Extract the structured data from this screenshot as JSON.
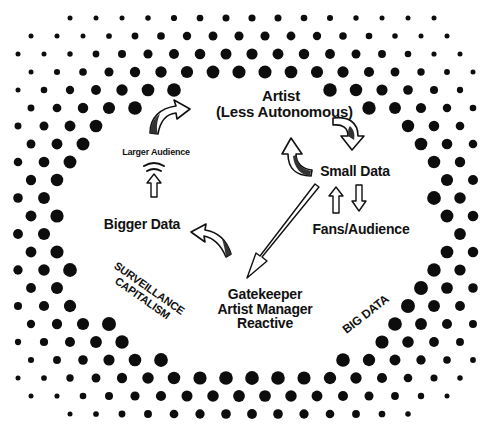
{
  "diagram": {
    "nodes": {
      "artist": {
        "line1": "Artist",
        "line2": "(Less Autonomous)"
      },
      "small_data": {
        "label": "Small Data"
      },
      "fans_audience": {
        "label": "Fans/Audience"
      },
      "gatekeeper": {
        "line1": "Gatekeeper",
        "line2": "Artist Manager",
        "line3": "Reactive"
      },
      "bigger_data": {
        "label": "Bigger Data"
      },
      "larger_audience": {
        "label": "Larger Audience"
      }
    },
    "annotations": {
      "surveillance": {
        "line1": "SURVEILLANCE",
        "line2": "CAPITALISM"
      },
      "big_data": {
        "label": "BIG DATA"
      }
    },
    "arrows": [
      {
        "name": "artist-to-small-data",
        "from": "Artist",
        "to": "Small Data",
        "style": "curved-3d"
      },
      {
        "name": "small-data-to-artist",
        "from": "Small Data",
        "to": "Artist",
        "style": "curved-3d"
      },
      {
        "name": "small-data-to-fans",
        "from": "Small Data",
        "to": "Fans/Audience",
        "style": "hollow-down"
      },
      {
        "name": "fans-to-small-data",
        "from": "Fans/Audience",
        "to": "Small Data",
        "style": "hollow-up"
      },
      {
        "name": "small-data-to-gatekeeper",
        "from": "Small Data",
        "to": "Gatekeeper",
        "style": "long-hollow-diagonal"
      },
      {
        "name": "gatekeeper-to-bigger-data",
        "from": "Gatekeeper",
        "to": "Bigger Data",
        "style": "curved-3d"
      },
      {
        "name": "bigger-data-to-larger-audience",
        "from": "Bigger Data",
        "to": "Larger Audience",
        "style": "hollow-up-with-signal"
      },
      {
        "name": "larger-audience-to-artist",
        "from": "Larger Audience",
        "to": "Artist",
        "style": "curved-3d"
      }
    ],
    "colors": {
      "background": "#ffffff",
      "ink": "#111111",
      "dot": "#0d0d0d"
    },
    "halftone_frame": {
      "width": 491,
      "height": 427,
      "outer_rect": {
        "x": 12,
        "y": 14,
        "w": 470,
        "h": 400,
        "radius": 55
      },
      "inner_oval": {
        "cx": 250,
        "cy": 228,
        "rx": 185,
        "ry": 148
      },
      "spacing_x": 26,
      "spacing_y": 18,
      "min_r": 2.5,
      "max_r": 7
    }
  }
}
